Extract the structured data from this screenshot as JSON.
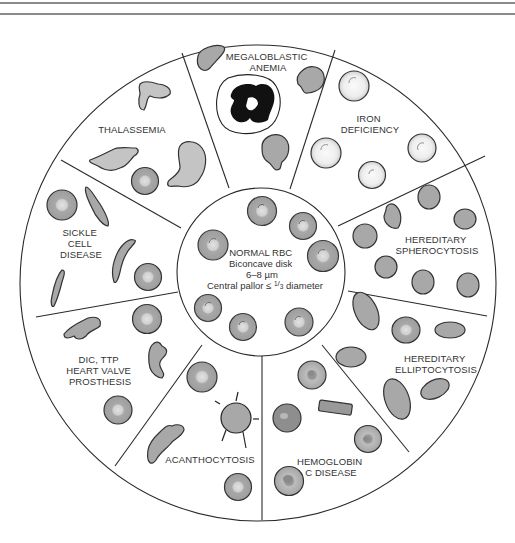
{
  "figure": {
    "center": {
      "label_lines": [
        "NORMAL RBC",
        "Biconcave disk",
        "6–8 µm",
        "Central pallor ≤ 1/3 diameter"
      ],
      "pallor_prefix": "Central pallor ≤ ",
      "fraction_num": "1",
      "fraction_den": "3",
      "pallor_suffix": " diameter"
    },
    "segments": [
      {
        "id": "megaloblastic-anemia",
        "lines": [
          "MEGALOBLASTIC",
          "ANEMIA"
        ]
      },
      {
        "id": "iron-deficiency",
        "lines": [
          "IRON",
          "DEFICIENCY"
        ]
      },
      {
        "id": "hereditary-spherocytosis",
        "lines": [
          "HEREDITARY",
          "SPHEROCYTOSIS"
        ]
      },
      {
        "id": "hereditary-elliptocytosis",
        "lines": [
          "HEREDITARY",
          "ELLIPTOCYTOSIS"
        ]
      },
      {
        "id": "hemoglobin-c-disease",
        "lines": [
          "HEMOGLOBIN",
          "C DISEASE"
        ]
      },
      {
        "id": "acanthocytosis",
        "lines": [
          "ACANTHOCYTOSIS"
        ]
      },
      {
        "id": "dic-ttp-heart-valve",
        "lines": [
          "DIC, TTP",
          "HEART VALVE",
          "PROSTHESIS"
        ]
      },
      {
        "id": "sickle-cell-disease",
        "lines": [
          "SICKLE",
          "CELL",
          "DISEASE"
        ]
      },
      {
        "id": "thalassemia",
        "lines": [
          "THALASSEMIA"
        ]
      }
    ],
    "colors": {
      "cell_fill": "#a9a9a9",
      "cell_stroke": "#3a3a3a",
      "pallor": "#d4d4d4",
      "iron_cell_fill": "#ececec",
      "nucleus": "#111111",
      "line": "#2a2a2a",
      "text": "#333333"
    }
  }
}
